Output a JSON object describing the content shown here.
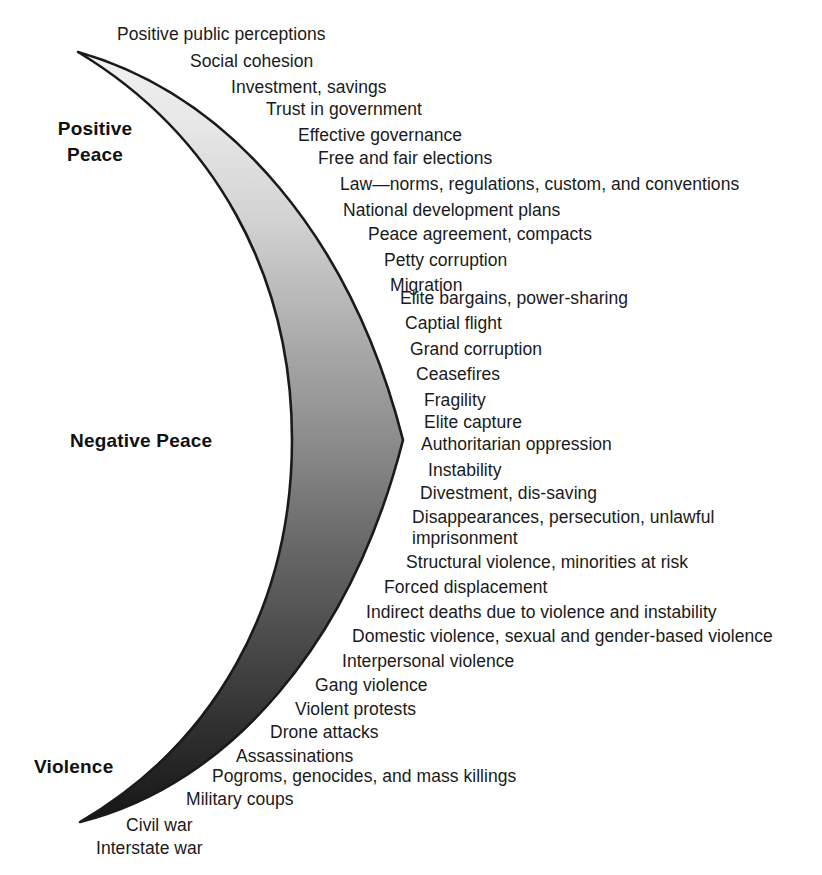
{
  "figure": {
    "background_color": "#ffffff",
    "text_color": "#1a1a1a",
    "outline_color": "#1a1a1a"
  },
  "axis_labels": {
    "positive_peace": "Positive\nPeace",
    "negative_peace": "Negative Peace",
    "violence": "Violence"
  },
  "gradient": {
    "top_color": "#ededed",
    "upper_mid_color": "#cfcfcf",
    "mid_color": "#8e8e8e",
    "lower_mid_color": "#4a4a4a",
    "bottom_color": "#1c1c1c"
  },
  "chart_data": {
    "type": "diagram",
    "scale_top": "Positive Peace",
    "scale_middle": "Negative Peace",
    "scale_bottom": "Violence",
    "items": [
      {
        "label": "Positive public perceptions",
        "x": 117,
        "y": 24
      },
      {
        "label": "Social cohesion",
        "x": 190,
        "y": 51
      },
      {
        "label": "Investment, savings",
        "x": 231,
        "y": 77
      },
      {
        "label": "Trust in government",
        "x": 266,
        "y": 99
      },
      {
        "label": "Effective governance",
        "x": 298,
        "y": 125
      },
      {
        "label": "Free and fair elections",
        "x": 318,
        "y": 148
      },
      {
        "label": "Law—norms, regulations, custom, and conventions",
        "x": 340,
        "y": 174
      },
      {
        "label": "National development plans",
        "x": 343,
        "y": 200
      },
      {
        "label": "Peace agreement, compacts",
        "x": 368,
        "y": 224
      },
      {
        "label": "Petty corruption",
        "x": 384,
        "y": 250
      },
      {
        "label": "Migration",
        "x": 390,
        "y": 275
      },
      {
        "label": "Elite bargains, power-sharing",
        "x": 400,
        "y": 288
      },
      {
        "label": "Captial flight",
        "x": 405,
        "y": 313
      },
      {
        "label": "Grand corruption",
        "x": 410,
        "y": 339
      },
      {
        "label": "Ceasefires",
        "x": 416,
        "y": 364
      },
      {
        "label": "Fragility",
        "x": 424,
        "y": 390
      },
      {
        "label": "Elite capture",
        "x": 424,
        "y": 412
      },
      {
        "label": "Authoritarian oppression",
        "x": 421,
        "y": 434
      },
      {
        "label": "Instability",
        "x": 428,
        "y": 460
      },
      {
        "label": "Divestment, dis-saving",
        "x": 420,
        "y": 483
      },
      {
        "label": "Disappearances, persecution, unlawful\nimprisonment",
        "x": 412,
        "y": 507
      },
      {
        "label": "Structural violence, minorities at risk",
        "x": 406,
        "y": 552
      },
      {
        "label": "Forced displacement",
        "x": 384,
        "y": 577
      },
      {
        "label": "Indirect deaths due to violence and instability",
        "x": 366,
        "y": 602
      },
      {
        "label": "Domestic violence, sexual and gender-based violence",
        "x": 352,
        "y": 626
      },
      {
        "label": "Interpersonal violence",
        "x": 342,
        "y": 651
      },
      {
        "label": "Gang violence",
        "x": 315,
        "y": 675
      },
      {
        "label": "Violent protests",
        "x": 295,
        "y": 699
      },
      {
        "label": "Drone attacks",
        "x": 270,
        "y": 722
      },
      {
        "label": "Assassinations",
        "x": 236,
        "y": 746
      },
      {
        "label": "Pogroms, genocides, and mass killings",
        "x": 212,
        "y": 766
      },
      {
        "label": "Military coups",
        "x": 186,
        "y": 789
      },
      {
        "label": "Civil war",
        "x": 126,
        "y": 815
      },
      {
        "label": "Interstate war",
        "x": 96,
        "y": 838
      }
    ]
  }
}
